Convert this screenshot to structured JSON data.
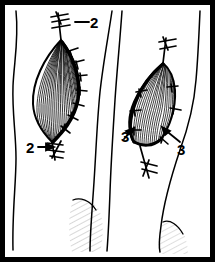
{
  "figure": {
    "type": "line-drawing",
    "background_color": "#ffffff",
    "ink_color": "#000000",
    "border": {
      "present": true,
      "color": "#000000",
      "thickness_px": 5
    },
    "canvas": {
      "width": 215,
      "height": 262
    }
  },
  "labels": [
    {
      "id": "label-2-top",
      "text": "2",
      "x": 96,
      "y": 26,
      "leader": "horizontal-dash-left"
    },
    {
      "id": "label-2-bottom",
      "text": "2",
      "x": 30,
      "y": 150,
      "leader": "arrow-right"
    },
    {
      "id": "label-3-left",
      "text": "3",
      "x": 126,
      "y": 136,
      "leader": "arrow-up-right"
    },
    {
      "id": "label-3-right",
      "text": "3",
      "x": 181,
      "y": 148,
      "leader": "arrow-up-left"
    }
  ],
  "wounds": [
    {
      "id": "wound-left",
      "name": "left-elliptical-wound",
      "shape": "lens-ellipse",
      "orientation": "vertical",
      "fill": "dense-parallel-hatching",
      "suture_count_label": "2",
      "sutures_side": "right-edge",
      "knots": [
        "top",
        "bottom"
      ]
    },
    {
      "id": "wound-right",
      "name": "right-elliptical-wound",
      "shape": "lens-ellipse",
      "orientation": "tilted",
      "fill": "dense-parallel-hatching",
      "suture_count_label": "3",
      "sutures_side": "both-edges",
      "knots": [
        "top",
        "bottom"
      ]
    }
  ],
  "contours": [
    {
      "id": "contour-left-limb",
      "description": "left limb outline, wavy vertical"
    },
    {
      "id": "contour-mid-left",
      "description": "middle-left limb outline"
    },
    {
      "id": "contour-mid-right",
      "description": "middle-right limb outline"
    },
    {
      "id": "contour-right-limb",
      "description": "right limb outline curving to bottom"
    }
  ],
  "shadows": [
    {
      "id": "shadow-center-bottom",
      "description": "faint hatched shading, lower center"
    },
    {
      "id": "shadow-right-bottom",
      "description": "faint hatched shading, lower right"
    }
  ]
}
